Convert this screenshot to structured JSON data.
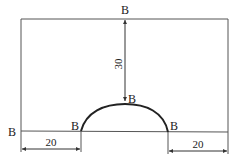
{
  "diagram": {
    "type": "engineering-drawing",
    "shape": "rectangle with semicircular-like arch on bottom edge",
    "colors": {
      "line": "#555555",
      "arc": "#222222",
      "text": "#222222"
    },
    "labels": {
      "top": "B",
      "arc_top": "B",
      "arc_left": "B",
      "arc_right": "B",
      "left_edge": "B"
    },
    "dimensions": {
      "vertical": "30",
      "bottom_left": "20",
      "bottom_right": "20"
    }
  }
}
